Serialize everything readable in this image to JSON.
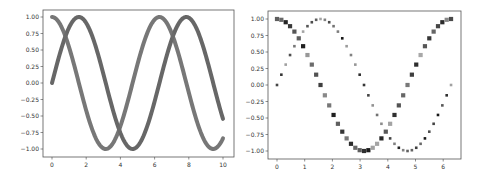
{
  "figure": {
    "width": 487,
    "height": 179,
    "background": "#ffffff"
  },
  "chart_data": [
    {
      "type": "line",
      "title": "",
      "xlabel": "",
      "ylabel": "",
      "xlim": [
        -0.5,
        10.5
      ],
      "ylim": [
        -1.1,
        1.1
      ],
      "grid": false,
      "legend": null,
      "x_ticks": [
        0,
        2,
        4,
        6,
        8,
        10
      ],
      "x_tick_labels": [
        "0",
        "2",
        "4",
        "6",
        "8",
        "10"
      ],
      "y_ticks": [
        1.0,
        0.75,
        0.5,
        0.25,
        0.0,
        -0.25,
        -0.5,
        -0.75,
        -1.0
      ],
      "y_tick_labels": [
        "1.00",
        "0.75",
        "0.50",
        "0.25",
        "0.00",
        "−0.25",
        "−0.50",
        "−0.75",
        "−1.00"
      ],
      "x_range": [
        0,
        10
      ],
      "series": [
        {
          "name": "sin(x)",
          "function": "sin",
          "color": "#5a5a5a",
          "line_width": 4
        },
        {
          "name": "cos(x)",
          "function": "cos",
          "color": "#6b6b6b",
          "line_width": 4
        }
      ],
      "pixel_box": {
        "left": 43,
        "top": 10,
        "right": 234,
        "bottom": 157
      },
      "pixel_map": {
        "x0": 52,
        "x_per_unit": 17.1,
        "y0": 83,
        "y_per_unit": 66
      }
    },
    {
      "type": "scatter",
      "title": "",
      "xlabel": "",
      "ylabel": "",
      "xlim": [
        -0.3,
        6.6
      ],
      "ylim": [
        -1.1,
        1.1
      ],
      "grid": false,
      "legend": null,
      "x_ticks": [
        0,
        1,
        2,
        3,
        4,
        5,
        6
      ],
      "x_tick_labels": [
        "0",
        "1",
        "2",
        "3",
        "4",
        "5",
        "6"
      ],
      "y_ticks": [
        1.0,
        0.75,
        0.5,
        0.25,
        0.0,
        -0.25,
        -0.5,
        -0.75,
        -1.0
      ],
      "y_tick_labels": [
        "1.00",
        "0.75",
        "0.50",
        "0.25",
        "0.00",
        "−0.25",
        "−0.50",
        "−0.75",
        "−1.00"
      ],
      "x_range": [
        0,
        6.2832
      ],
      "n_points": 41,
      "series": [
        {
          "name": "sin(x)",
          "function": "sin",
          "marker": "square",
          "marker_size": 2.6,
          "shade_seed": 3
        },
        {
          "name": "cos(x)",
          "function": "cos",
          "marker": "square",
          "marker_size": 4.2,
          "shade_seed": 7
        }
      ],
      "pixel_box": {
        "left": 268,
        "top": 11,
        "right": 461,
        "bottom": 159
      },
      "pixel_map": {
        "x0": 277,
        "x_per_unit": 27.7,
        "y0": 85,
        "y_per_unit": 66
      }
    }
  ]
}
